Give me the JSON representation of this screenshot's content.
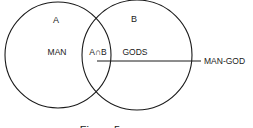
{
  "diagram": {
    "type": "venn",
    "stroke_color": "#1a1a1a",
    "background": "#ffffff",
    "sets": [
      {
        "id": "A",
        "label": "A",
        "region_label": "MAN"
      },
      {
        "id": "B",
        "label": "B",
        "region_label": "GODS"
      }
    ],
    "intersection": {
      "label": "A∩B"
    },
    "pointer": {
      "label": "MAN-GOD"
    },
    "caption": {
      "text": "Figure 5",
      "note": "cut off at bottom edge; only tops of glyphs visible"
    }
  }
}
